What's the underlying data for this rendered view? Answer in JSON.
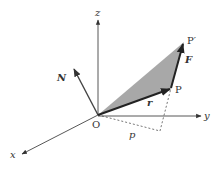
{
  "diagram": {
    "colors": {
      "line": "#333333",
      "axis": "#444444",
      "fill": "#a8a8a8",
      "dash": "#555555",
      "background": "#ffffff"
    },
    "labels": {
      "z": "z",
      "y": "y",
      "x": "x",
      "origin": "O",
      "P": "P",
      "P_prime": "P′",
      "N": "N",
      "F": "F",
      "r": "r",
      "p": "p"
    },
    "elements": [
      {
        "id": "z-axis",
        "kind": "axis",
        "label": "z"
      },
      {
        "id": "y-axis",
        "kind": "axis",
        "label": "y"
      },
      {
        "id": "x-axis",
        "kind": "axis",
        "label": "x"
      },
      {
        "id": "vector-r",
        "kind": "vector",
        "from": "O",
        "to": "P",
        "label": "r"
      },
      {
        "id": "vector-F",
        "kind": "vector",
        "from": "P",
        "to": "P′",
        "label": "F"
      },
      {
        "id": "vector-N",
        "kind": "vector",
        "from": "O",
        "label": "N"
      },
      {
        "id": "triangle-OPP'",
        "kind": "shaded-area",
        "vertices": [
          "O",
          "P",
          "P′"
        ]
      },
      {
        "id": "perpendicular-p",
        "kind": "dashed-line",
        "label": "p"
      }
    ]
  }
}
